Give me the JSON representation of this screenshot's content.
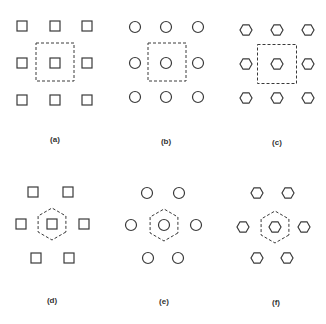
{
  "figure": {
    "stroke_color": "#3a3a3a",
    "background": "#ffffff",
    "panels": [
      {
        "id": "a",
        "label": "(a)",
        "label_pos": [
          55,
          140
        ],
        "element_shape": "square",
        "arrangement": "square-lattice 3x3",
        "unit_cell_shape": "square",
        "unit_cell": {
          "cx": 55,
          "cy": 62,
          "size": 38
        },
        "elements": [
          [
            22,
            26
          ],
          [
            55,
            26
          ],
          [
            87,
            26
          ],
          [
            22,
            63
          ],
          [
            55,
            63
          ],
          [
            87,
            63
          ],
          [
            22,
            100
          ],
          [
            55,
            100
          ],
          [
            87,
            100
          ]
        ]
      },
      {
        "id": "b",
        "label": "(b)",
        "label_pos": [
          166,
          142
        ],
        "element_shape": "circle",
        "arrangement": "square-lattice 3x3",
        "unit_cell_shape": "square",
        "unit_cell": {
          "cx": 167,
          "cy": 62,
          "size": 38
        },
        "elements": [
          [
            135,
            27
          ],
          [
            166,
            27
          ],
          [
            198,
            27
          ],
          [
            135,
            63
          ],
          [
            166,
            63
          ],
          [
            198,
            63
          ],
          [
            135,
            97
          ],
          [
            166,
            97
          ],
          [
            198,
            97
          ]
        ]
      },
      {
        "id": "c",
        "label": "(c)",
        "label_pos": [
          277,
          143
        ],
        "element_shape": "hexagon",
        "arrangement": "square-lattice 3x3",
        "unit_cell_shape": "square",
        "unit_cell": {
          "cx": 277,
          "cy": 64,
          "size": 39
        },
        "elements": [
          [
            246,
            30
          ],
          [
            277,
            30
          ],
          [
            308,
            30
          ],
          [
            246,
            64
          ],
          [
            277,
            64
          ],
          [
            308,
            64
          ],
          [
            246,
            98
          ],
          [
            277,
            98
          ],
          [
            308,
            98
          ]
        ]
      },
      {
        "id": "d",
        "label": "(d)",
        "label_pos": [
          52,
          301
        ],
        "element_shape": "square",
        "arrangement": "hexagonal-lattice 7",
        "unit_cell_shape": "hexagon",
        "unit_cell": {
          "cx": 52,
          "cy": 224,
          "r": 16
        },
        "elements": [
          [
            33,
            192
          ],
          [
            68,
            192
          ],
          [
            21,
            224
          ],
          [
            52,
            224
          ],
          [
            84,
            224
          ],
          [
            36,
            258
          ],
          [
            69,
            258
          ]
        ]
      },
      {
        "id": "e",
        "label": "(e)",
        "label_pos": [
          164,
          302
        ],
        "element_shape": "circle",
        "arrangement": "hexagonal-lattice 7",
        "unit_cell_shape": "hexagon",
        "unit_cell": {
          "cx": 164,
          "cy": 225,
          "r": 16
        },
        "elements": [
          [
            147,
            193
          ],
          [
            179,
            193
          ],
          [
            131,
            225
          ],
          [
            164,
            225
          ],
          [
            196,
            225
          ],
          [
            148,
            258
          ],
          [
            178,
            258
          ]
        ]
      },
      {
        "id": "f",
        "label": "(f)",
        "label_pos": [
          276,
          303
        ],
        "element_shape": "hexagon",
        "arrangement": "hexagonal-lattice 7",
        "unit_cell_shape": "hexagon",
        "unit_cell": {
          "cx": 275,
          "cy": 227,
          "r": 16
        },
        "elements": [
          [
            257,
            193
          ],
          [
            288,
            193
          ],
          [
            243,
            227
          ],
          [
            275,
            227
          ],
          [
            304,
            227
          ],
          [
            257,
            258
          ],
          [
            287,
            258
          ]
        ]
      }
    ]
  },
  "caption_fragment": "Hnlu a ulkjnnaln ujnalo d"
}
